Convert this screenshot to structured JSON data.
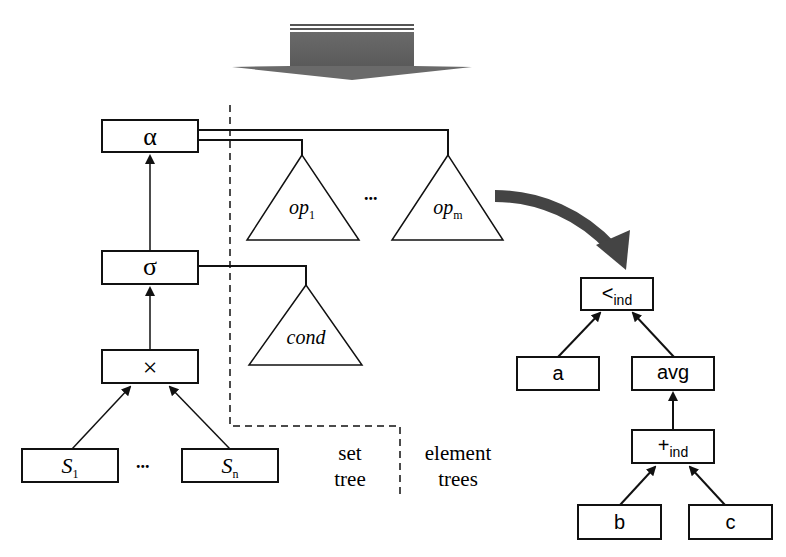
{
  "diagram": {
    "set_tree": {
      "nodes": {
        "alpha": "α",
        "sigma": "σ",
        "cross": "×",
        "s1_base": "S",
        "s1_sub": "1",
        "sn_base": "S",
        "sn_sub": "n",
        "ellipsis": "..."
      },
      "label_line1": "set",
      "label_line2": "tree"
    },
    "element_trees": {
      "op1_base": "op",
      "op1_sub": "1",
      "opm_base": "op",
      "opm_sub": "m",
      "ellipsis": "...",
      "cond": "cond",
      "label_line1": "element",
      "label_line2": "trees"
    },
    "expanded_tree": {
      "root_base": "<",
      "root_sub": "ind",
      "a": "a",
      "avg": "avg",
      "plus_base": "+",
      "plus_sub": "ind",
      "b": "b",
      "c": "c"
    },
    "colors": {
      "line": "#111111",
      "arrow_fill": "#555555"
    }
  }
}
